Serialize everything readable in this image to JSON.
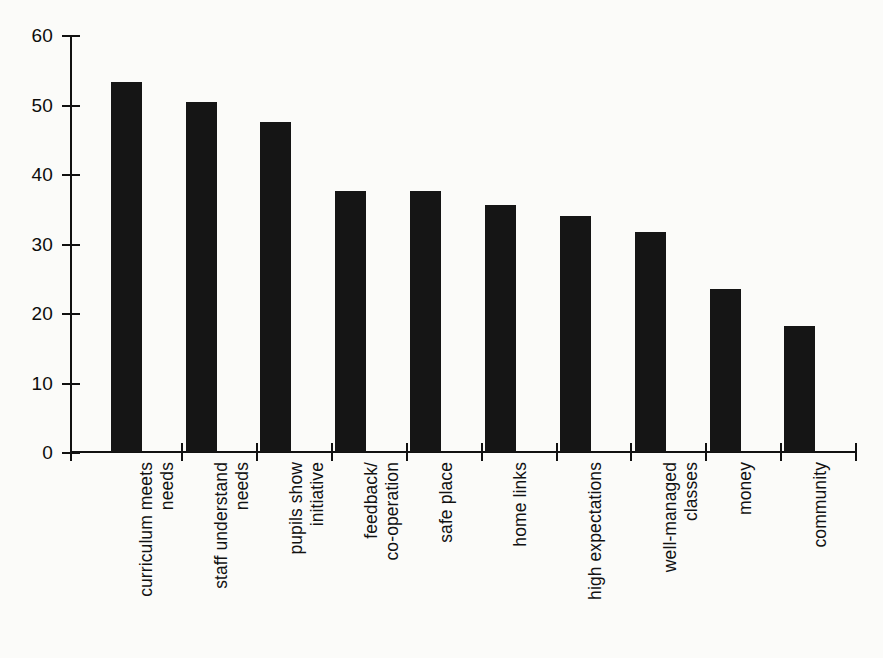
{
  "chart_data": {
    "type": "bar",
    "title": "",
    "subtitle": "",
    "xlabel": "",
    "ylabel": "",
    "ylim": [
      0,
      60
    ],
    "yticks": [
      0,
      10,
      20,
      30,
      40,
      50,
      60
    ],
    "grid": false,
    "legend": false,
    "orientation": "vertical",
    "bar_color": "#151515",
    "background_color": "#fbfbf9",
    "categories": [
      "curriculum meets\nneeds",
      "staff understand\nneeds",
      "pupils show\ninitiative",
      "feedback/\nco-operation",
      "safe place",
      "home links",
      "high expectations",
      "well-managed\nclasses",
      "money",
      "community"
    ],
    "values": [
      53.3,
      50.3,
      47.5,
      37.5,
      37.5,
      35.5,
      34.0,
      31.7,
      23.5,
      18.2
    ]
  },
  "axes": {
    "y_tick_labels": [
      "0",
      "10",
      "20",
      "30",
      "40",
      "50",
      "60"
    ]
  }
}
